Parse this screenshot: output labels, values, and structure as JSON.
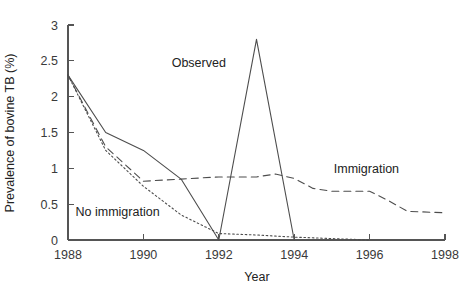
{
  "chart_data": {
    "type": "line",
    "title": "",
    "xlabel": "Year",
    "ylabel": "Prevalence of bovine TB (%)",
    "xlim": [
      1988,
      1998
    ],
    "ylim": [
      0,
      3
    ],
    "xticks": [
      1988,
      1990,
      1992,
      1994,
      1996,
      1998
    ],
    "xtick_labels": [
      "1988",
      "1990",
      "1992",
      "1994",
      "1996",
      "1998"
    ],
    "yticks": [
      0,
      0.5,
      1,
      1.5,
      2,
      2.5,
      3
    ],
    "ytick_labels": [
      "0",
      "0.5",
      "1",
      "1.5",
      "2",
      "2.5",
      "3"
    ],
    "grid": false,
    "legend_position": "inline-annotations",
    "series": [
      {
        "name": "Observed",
        "style": "solid",
        "color": "#4d4d4d",
        "x": [
          1988,
          1989,
          1990,
          1991,
          1992,
          1993,
          1994
        ],
        "values": [
          2.3,
          1.5,
          1.25,
          0.85,
          0.0,
          2.8,
          0.0
        ]
      },
      {
        "name": "Immigration",
        "style": "dashed",
        "color": "#4d4d4d",
        "x": [
          1988,
          1989,
          1990,
          1991,
          1992,
          1993,
          1993.5,
          1994,
          1994.5,
          1995,
          1996,
          1996.5,
          1997,
          1998
        ],
        "values": [
          2.3,
          1.3,
          0.82,
          0.85,
          0.88,
          0.88,
          0.92,
          0.86,
          0.72,
          0.68,
          0.68,
          0.55,
          0.4,
          0.38
        ]
      },
      {
        "name": "No immigration",
        "style": "dotted",
        "color": "#4d4d4d",
        "x": [
          1988,
          1989,
          1990,
          1991,
          1992,
          1993,
          1994,
          1995,
          1996
        ],
        "values": [
          2.3,
          1.25,
          0.75,
          0.35,
          0.09,
          0.07,
          0.04,
          0.02,
          0.0
        ]
      }
    ],
    "annotations": [
      {
        "text": "Observed",
        "x": 1990.75,
        "y": 2.42
      },
      {
        "text": "Immigration",
        "x": 1995.05,
        "y": 0.93
      },
      {
        "text": "No immigration",
        "x": 1988.2,
        "y": 0.33
      }
    ]
  }
}
